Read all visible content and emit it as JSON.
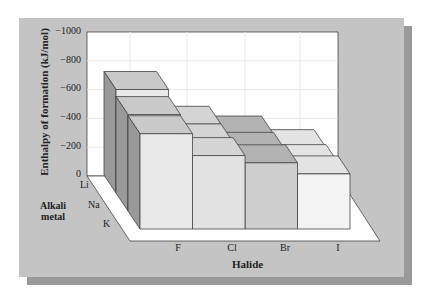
{
  "chart_data": {
    "type": "bar3d",
    "title": "",
    "ylabel": "Enthalpy of formation (kJ/mol)",
    "xlabel": "Halide",
    "zlabel": "Alkali metal",
    "ylim": [
      0,
      -1000
    ],
    "yticks": [
      "-1000",
      "-800",
      "-600",
      "-400",
      "-200",
      "0"
    ],
    "categories": [
      "F",
      "Cl",
      "Br",
      "I"
    ],
    "rows": [
      "Li",
      "Na",
      "K"
    ],
    "series": [
      {
        "name": "Li",
        "values": [
          -616,
          -409,
          -351,
          -270
        ]
      },
      {
        "name": "Na",
        "values": [
          -574,
          -411,
          -361,
          -288
        ]
      },
      {
        "name": "K",
        "values": [
          -567,
          -437,
          -394,
          -328
        ]
      }
    ],
    "grid": true,
    "colors": {
      "panel": "#c4c4c4",
      "wall": "#ffffff",
      "F_front": "#e9e9e9",
      "Cl_front": "#e2e2e2",
      "Br_front": "#d0d0d0",
      "I_front": "#f2f2f2"
    }
  },
  "labels": {
    "ylabel": "Enthalpy of formation (kJ/mol)",
    "xlabel": "Halide",
    "zlabel_line1": "Alkali",
    "zlabel_line2": "metal",
    "yticks": [
      "-1000",
      "-800",
      "-600",
      "-400",
      "-200",
      "0"
    ],
    "rows": [
      "Li",
      "Na",
      "K"
    ],
    "cols": [
      "F",
      "Cl",
      "Br",
      "I"
    ]
  }
}
